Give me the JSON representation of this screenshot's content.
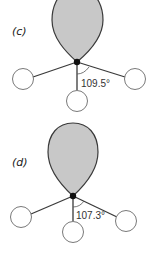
{
  "panels": [
    {
      "label": "(c)",
      "angle": "109.5°"
    },
    {
      "label": "(d)",
      "angle": "107.3°"
    }
  ],
  "colors": {
    "lobe_fill": "#c8c8c8",
    "lobe_stroke": "#3a3a3a",
    "atom_stroke": "#6a6a6a",
    "nucleus": "#111111"
  }
}
